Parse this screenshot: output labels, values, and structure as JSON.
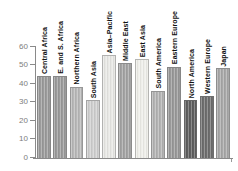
{
  "chart_data": {
    "type": "bar",
    "title": "",
    "xlabel": "",
    "ylabel": "",
    "categories": [
      "Central Africa",
      "E. and S. Africa",
      "Northern Africa",
      "South Asia",
      "Asia–Pacific",
      "Middle East",
      "East Asia",
      "South America",
      "Eastern Europe",
      "North America",
      "Western Europe",
      "Japan"
    ],
    "values": [
      44,
      44,
      38,
      31,
      55,
      51,
      53,
      36,
      49,
      31,
      33,
      48
    ],
    "bar_colors": [
      "#9b9b9b",
      "#9b9b9b",
      "#b8b8b8",
      "#cfcfcf",
      "#e8e8e5",
      "#a3a3a3",
      "#efefea",
      "#b3b3b3",
      "#999999",
      "#5e5e5e",
      "#6e6e6e",
      "#a8a8a8"
    ],
    "ylim": [
      0,
      60
    ],
    "yticks": [
      0,
      10,
      20,
      30,
      40,
      50,
      60
    ],
    "grid": false,
    "legend": null,
    "axis_color": "#8a8a8a",
    "tick_label_color": "#7d7d7d",
    "bar_label_color": "#111111"
  }
}
